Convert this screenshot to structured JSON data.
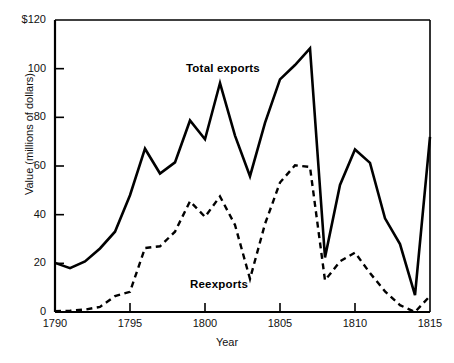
{
  "chart_data": {
    "type": "line",
    "title": "",
    "xlabel": "Year",
    "ylabel": "Value (millions of dollars)",
    "xlim": [
      1790,
      1815
    ],
    "ylim": [
      0,
      120
    ],
    "grid": false,
    "legend_position": "inline-annotations",
    "x": [
      1790,
      1791,
      1792,
      1793,
      1794,
      1795,
      1796,
      1797,
      1798,
      1799,
      1800,
      1801,
      1802,
      1803,
      1804,
      1805,
      1806,
      1807,
      1808,
      1809,
      1810,
      1811,
      1812,
      1813,
      1814,
      1815
    ],
    "xticks": [
      "1790",
      "1795",
      "1800",
      "1805",
      "1810",
      "1815"
    ],
    "ytick_labels": [
      "$120",
      "100",
      "80",
      "60",
      "40",
      "20",
      "0"
    ],
    "yticks": [
      120,
      100,
      80,
      60,
      40,
      20,
      0
    ],
    "series": [
      {
        "name": "Total exports",
        "style": "solid",
        "color": "#000000",
        "values": [
          20.2,
          18.0,
          20.8,
          26.1,
          33.0,
          48.0,
          67.1,
          56.9,
          61.5,
          78.7,
          71.0,
          94.1,
          72.5,
          55.8,
          77.7,
          95.6,
          101.5,
          108.3,
          22.4,
          52.2,
          66.8,
          61.3,
          38.5,
          27.9,
          6.9,
          72.0
        ]
      },
      {
        "name": "Reexports",
        "style": "dashed",
        "color": "#000000",
        "values": [
          0.3,
          0.5,
          1.0,
          2.1,
          6.5,
          8.3,
          26.3,
          27.0,
          33.0,
          45.5,
          39.1,
          47.5,
          35.8,
          13.6,
          36.2,
          53.2,
          60.3,
          59.6,
          13.0,
          20.8,
          24.4,
          16.0,
          8.5,
          2.8,
          0.0,
          6.6
        ]
      }
    ],
    "annotations": [
      {
        "text": "Total exports",
        "x": 1799,
        "y": 112
      },
      {
        "text": "Reexports",
        "x": 1801,
        "y": 16
      }
    ]
  }
}
